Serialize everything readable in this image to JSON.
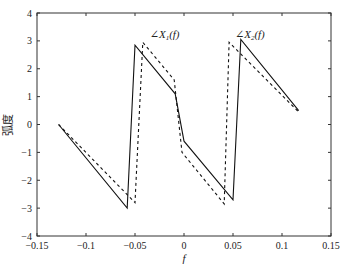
{
  "chart_data": {
    "type": "line",
    "title": "",
    "xlabel": "f",
    "ylabel": "弧度",
    "xlim": [
      -0.15,
      0.15
    ],
    "ylim": [
      -4,
      4
    ],
    "grid": false,
    "x_ticks": [
      -0.15,
      -0.1,
      -0.05,
      0,
      0.05,
      0.1,
      0.15
    ],
    "x_tick_labels": [
      "-0.15",
      "-0.1",
      "-0.05",
      "0",
      "0.05",
      "0.1",
      "0.15"
    ],
    "y_ticks": [
      4,
      3,
      2,
      1,
      0,
      -1,
      -2,
      -3,
      -4
    ],
    "y_tick_labels": [
      "4",
      "3",
      "2",
      "1",
      "0",
      "-1",
      "-2",
      "-3",
      "-4"
    ],
    "series": [
      {
        "name": "∠X1(f)",
        "style": "solid",
        "x": [
          -0.128,
          -0.058,
          -0.05,
          -0.009,
          0.0,
          0.05,
          0.058,
          0.117
        ],
        "y": [
          0.0,
          -3.0,
          2.85,
          1.1,
          -0.6,
          -2.7,
          3.05,
          0.5
        ]
      },
      {
        "name": "∠X2(f)",
        "style": "dashed",
        "x": [
          -0.128,
          -0.05,
          -0.042,
          -0.01,
          -0.002,
          0.041,
          0.046,
          0.117
        ],
        "y": [
          0.0,
          -2.8,
          2.95,
          1.6,
          -1.0,
          -2.85,
          2.95,
          0.45
        ]
      }
    ],
    "annotations": [
      {
        "text": "∠X1(f)",
        "x": -0.035,
        "y": 3.1
      },
      {
        "text": "∠X2(f)",
        "x": 0.052,
        "y": 3.1
      }
    ]
  }
}
